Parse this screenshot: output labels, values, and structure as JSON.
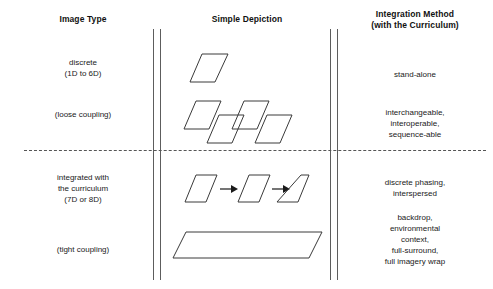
{
  "diagram": {
    "headers": {
      "image_type": "Image Type",
      "simple_depiction": "Simple Depiction",
      "integration_method_line1": "Integration Method",
      "integration_method_line2": "(with the Curriculum)"
    },
    "rows": [
      {
        "image_type_line1": "discrete",
        "image_type_line2": "(1D to 6D)",
        "depiction": "single-parallelogram",
        "integration": "stand-alone"
      },
      {
        "image_type_line1": "(loose coupling)",
        "depiction": "four-staggered-parallelograms",
        "integration_line1": "interchangeable,",
        "integration_line2": "interoperable,",
        "integration_line3": "sequence-able"
      },
      {
        "image_type_line1": "integrated with",
        "image_type_line2": "the curriculum",
        "image_type_line3": "(7D or 8D)",
        "depiction": "three-parallelograms-with-arrows",
        "integration_line1": "discrete phasing,",
        "integration_line2": "interspersed"
      },
      {
        "image_type_line1": "(tight coupling)",
        "depiction": "wide-parallelogram",
        "integration_line1": "backdrop,",
        "integration_line2": "environmental",
        "integration_line3": "context,",
        "integration_line4": "full-surround,",
        "integration_line5": "full imagery wrap"
      }
    ],
    "colors": {
      "stroke": "#3a3a3a",
      "rule": "#5d5d5d",
      "text": "#1a1a1a",
      "background": "#ffffff"
    }
  }
}
